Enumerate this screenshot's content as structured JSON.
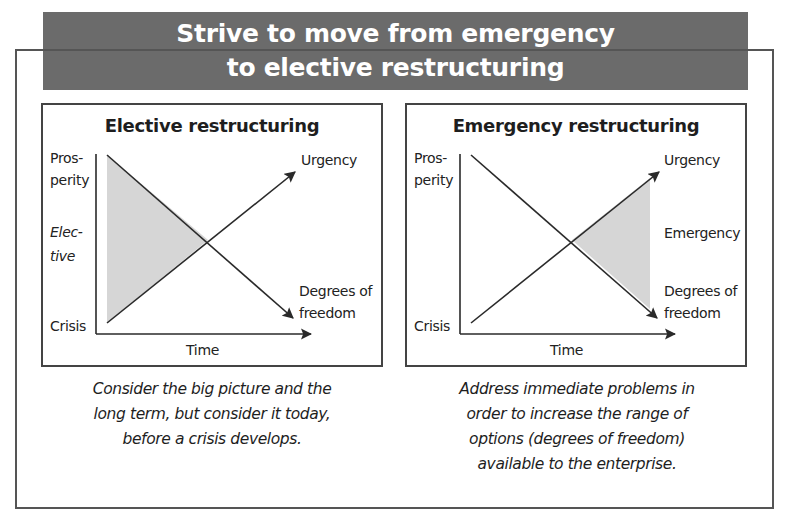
{
  "title": {
    "line1": "Strive to move from emergency",
    "line2": "to elective restructuring"
  },
  "colors": {
    "banner_bg": "#6b6b6b",
    "banner_text": "#ffffff",
    "shade": "#d6d6d6",
    "line": "#2a2a2a",
    "frame": "#555555"
  },
  "panels": [
    {
      "title": "Elective restructuring",
      "y_top_label_1": "Pros-",
      "y_top_label_2": "perity",
      "y_mid_label_1": "Elec-",
      "y_mid_label_2": "tive",
      "y_bottom_label": "Crisis",
      "x_label": "Time",
      "urgency_label": "Urgency",
      "dof_label_1": "Degrees of",
      "dof_label_2": "freedom",
      "caption_lines": [
        "Consider the big picture and the",
        "long term, but consider it today,",
        "before a crisis develops."
      ]
    },
    {
      "title": "Emergency restructuring",
      "y_top_label_1": "Pros-",
      "y_top_label_2": "perity",
      "y_bottom_label": "Crisis",
      "x_label": "Time",
      "urgency_label": "Urgency",
      "emergency_label": "Emergency",
      "dof_label_1": "Degrees of",
      "dof_label_2": "freedom",
      "caption_lines": [
        "Address immediate problems in",
        "order to increase the range of",
        "options (degrees of freedom)",
        "available to the enterprise."
      ]
    }
  ]
}
